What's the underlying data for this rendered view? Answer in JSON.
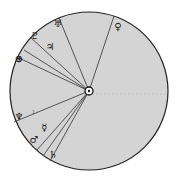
{
  "diagram": {
    "type": "heliocentric-planet-positions",
    "colors": {
      "disc_fill": "#d4d4d4",
      "outline": "#222222",
      "line": "#444444",
      "background": "#ffffff"
    },
    "center": {
      "symbol": "☉",
      "label": "Sun"
    },
    "planets": [
      {
        "name": "Uranus",
        "symbol": "♅",
        "x": 58,
        "y": 17
      },
      {
        "name": "Venus",
        "symbol": "♀",
        "x": 118,
        "y": 19
      },
      {
        "name": "Pluto",
        "symbol": "♇",
        "x": 35,
        "y": 34
      },
      {
        "name": "Jupiter",
        "symbol": "♃",
        "x": 50,
        "y": 45
      },
      {
        "name": "Earth",
        "symbol": "⊕",
        "x": 19,
        "y": 58
      },
      {
        "name": "Neptune",
        "symbol": "♆",
        "x": 18,
        "y": 117
      },
      {
        "name": "Mercury",
        "symbol": "☿",
        "x": 45,
        "y": 126
      },
      {
        "name": "Mars",
        "symbol": "♂",
        "x": 33,
        "y": 139
      },
      {
        "name": "Saturn",
        "symbol": "♄",
        "x": 52,
        "y": 155
      }
    ],
    "small_marks": [
      {
        "text": "1",
        "x": 32,
        "y": 113
      }
    ]
  }
}
